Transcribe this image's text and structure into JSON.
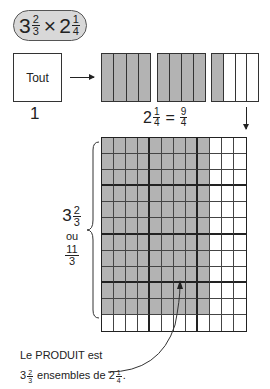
{
  "problem": {
    "whole1": "3",
    "num1": "2",
    "den1": "3",
    "op": "×",
    "whole2": "2",
    "num2": "1",
    "den2": "4"
  },
  "unit_box": {
    "label": "Tout",
    "caption": "1"
  },
  "bars": [
    {
      "shaded": 4,
      "total": 4
    },
    {
      "shaded": 4,
      "total": 4
    },
    {
      "shaded": 1,
      "total": 4
    }
  ],
  "equation": {
    "whole": "2",
    "num": "1",
    "den": "4",
    "eq": "=",
    "num2": "9",
    "den2": "4"
  },
  "grid": {
    "cols": 12,
    "rows": 12,
    "shaded_cols": 9,
    "shaded_rows": 11,
    "group_cols": 4,
    "group_rows": 3
  },
  "side_label": {
    "whole": "3",
    "num": "2",
    "den": "3",
    "or": "ou",
    "num2": "11",
    "den2": "3"
  },
  "product_text": {
    "line1": "Le PRODUIT est",
    "whole": "3",
    "num": "2",
    "den": "3",
    "mid": "ensembles de",
    "whole2": "2",
    "num2": "1",
    "den2": "4",
    "end": "."
  },
  "colors": {
    "shade": "#b3b3b3",
    "line": "#222222",
    "pill": "#d8d8d8"
  }
}
